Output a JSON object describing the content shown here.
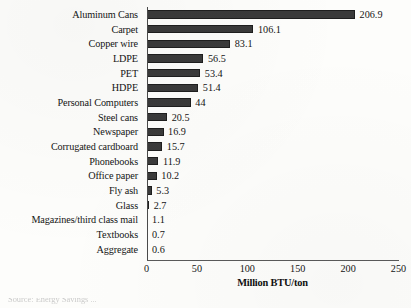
{
  "chart_data": {
    "type": "bar",
    "orientation": "horizontal",
    "title": "",
    "xlabel": "Million BTU/ton",
    "ylabel": "",
    "xlim": [
      0,
      250
    ],
    "xticks": [
      0,
      50,
      100,
      150,
      200,
      250
    ],
    "grid": false,
    "legend": null,
    "categories": [
      "Aluminum Cans",
      "Carpet",
      "Copper wire",
      "LDPE",
      "PET",
      "HDPE",
      "Personal Computers",
      "Steel cans",
      "Newspaper",
      "Corrugated cardboard",
      "Phonebooks",
      "Office paper",
      "Fly ash",
      "Glass",
      "Magazines/third class mail",
      "Textbooks",
      "Aggregate"
    ],
    "values": [
      206.9,
      106.1,
      83.1,
      56.5,
      53.4,
      51.4,
      44,
      20.5,
      16.9,
      15.7,
      11.9,
      10.2,
      5.3,
      2.7,
      1.1,
      0.7,
      0.6
    ],
    "value_labels": [
      "206.9",
      "106.1",
      "83.1",
      "56.5",
      "53.4",
      "51.4",
      "44",
      "20.5",
      "16.9",
      "15.7",
      "11.9",
      "10.2",
      "5.3",
      "2.7",
      "1.1",
      "0.7",
      "0.6"
    ],
    "bar_color": "#3a3a3a"
  },
  "caption": {
    "partial_text": "Source: Energy Savings ..."
  }
}
